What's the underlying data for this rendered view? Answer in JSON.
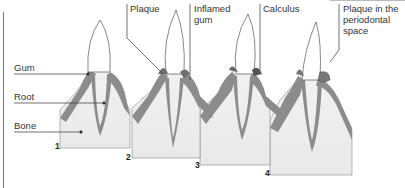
{
  "diagram": {
    "labels": {
      "gum": "Gum",
      "root": "Root",
      "bone": "Bone",
      "plaque": "Plaque",
      "inflamed_gum_1": "Inflamed",
      "inflamed_gum_2": "gum",
      "calculus": "Calculus",
      "plaque_space_1": "Plaque in the",
      "plaque_space_2": "periodontal",
      "plaque_space_3": "space"
    },
    "stages": [
      {
        "number": "1"
      },
      {
        "number": "2"
      },
      {
        "number": "3"
      },
      {
        "number": "4"
      }
    ],
    "colors": {
      "gum": "#8c8c8c",
      "bone": "#eeeeee",
      "tooth": "#ffffff",
      "outline": "#555555",
      "leader": "#333333"
    }
  }
}
